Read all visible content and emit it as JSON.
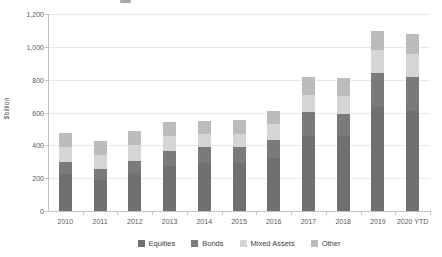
{
  "y_axis": {
    "label": "$billion",
    "ticks": [
      "0",
      "200",
      "400",
      "600",
      "800",
      "1,000",
      "1,200"
    ]
  },
  "chart_data": {
    "type": "bar",
    "stacked": true,
    "title": "",
    "xlabel": "",
    "ylabel": "$billion",
    "ylim": [
      0,
      1200
    ],
    "ytick_step": 200,
    "grid": true,
    "legend_position": "bottom",
    "categories": [
      "2010",
      "2011",
      "2012",
      "2013",
      "2014",
      "2015",
      "2016",
      "2017",
      "2018",
      "2019",
      "2020 YTD"
    ],
    "series": [
      {
        "name": "Equities",
        "color": "#707070",
        "values": [
          225,
          190,
          230,
          275,
          290,
          290,
          325,
          455,
          455,
          635,
          610
        ]
      },
      {
        "name": "Bonds",
        "color": "#7a7a7a",
        "values": [
          75,
          65,
          75,
          90,
          100,
          100,
          110,
          150,
          135,
          210,
          205
        ]
      },
      {
        "name": "Mixed Assets",
        "color": "#d5d5d5",
        "values": [
          90,
          85,
          95,
          90,
          80,
          80,
          95,
          105,
          110,
          140,
          145
        ]
      },
      {
        "name": "Other",
        "color": "#bcbcbc",
        "values": [
          85,
          85,
          90,
          90,
          80,
          85,
          80,
          110,
          110,
          115,
          120
        ]
      }
    ],
    "totals": [
      475,
      425,
      490,
      545,
      550,
      555,
      610,
      820,
      810,
      1100,
      1080
    ]
  },
  "style": {
    "gridline_color": "#e9e9e9",
    "axis_color": "#c2c2c2",
    "tick_text_color": "#595959",
    "background": "#ffffff"
  }
}
